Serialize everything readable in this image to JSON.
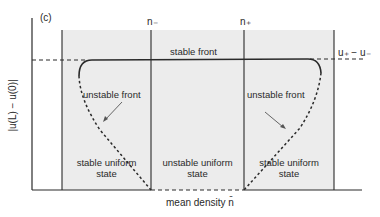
{
  "figure": {
    "panel_label": "(c)",
    "y_axis_label": "|u(L) − u(0)|",
    "x_axis_label": "mean density n̄",
    "top_markers": {
      "n_minus": "n₋",
      "n_plus": "n₊"
    },
    "right_marker": "u₊ − u₋",
    "curve_labels": {
      "stable_front": "stable front",
      "unstable_front_left": "unstable front",
      "unstable_front_right": "unstable front"
    },
    "region_labels": {
      "left": [
        "stable uniform",
        "state"
      ],
      "middle": [
        "unstable uniform",
        "state"
      ],
      "right": [
        "stable uniform",
        "state"
      ]
    },
    "colors": {
      "shaded_region": "#ececec",
      "lines": "#2a2a2a",
      "background": "#ffffff"
    }
  }
}
